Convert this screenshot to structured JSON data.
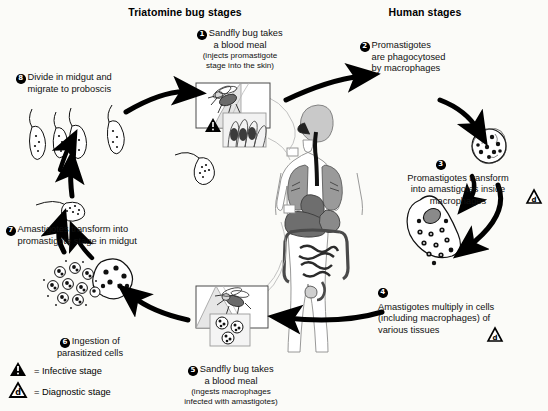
{
  "diagram": {
    "headers": {
      "left": "Triatomine bug stages",
      "right": "Human stages"
    },
    "steps": [
      {
        "num": "1",
        "title": "Sandfly bug takes",
        "title2": "a blood meal",
        "sub": "(injects promastigote",
        "sub2": "stage into the skin)",
        "marker": "infective"
      },
      {
        "num": "2",
        "line1": "Promastigotes",
        "line2": "are phagocytosed",
        "line3": "by macrophages",
        "marker": "none"
      },
      {
        "num": "3",
        "line1": "Promastigotes transform",
        "line2": "into amastigotes inside",
        "line3": "macrophages",
        "marker": "diagnostic"
      },
      {
        "num": "4",
        "line1": "Amastigotes multiply in cells",
        "line2": "(including macrophages) of",
        "line3": "various tissues",
        "marker": "diagnostic"
      },
      {
        "num": "5",
        "title": "Sandfly bug takes",
        "title2": "a blood meal",
        "sub": "(ingests macrophages",
        "sub2": "infected with amastigotes)",
        "marker": "none"
      },
      {
        "num": "6",
        "line1": "Ingestion of",
        "line2": "parasitized cells",
        "marker": "none"
      },
      {
        "num": "7",
        "line1": "Amastigotes transform into",
        "line2": "promastigote stage in midgut",
        "marker": "none"
      },
      {
        "num": "8",
        "line1": "Divide in midgut and",
        "line2": "migrate to proboscis",
        "marker": "none"
      }
    ],
    "legend": [
      {
        "symbol": "infective-triangle",
        "glyph": "!",
        "text": "= Infective stage"
      },
      {
        "symbol": "diagnostic-triangle",
        "glyph": "d",
        "text": "= Diagnostic stage"
      }
    ],
    "colors": {
      "background": "#fbfbf8",
      "ink": "#000000",
      "organ_gray": "#9a9a9a",
      "organ_dark": "#6e6e6e",
      "organ_light": "#c9c9c9",
      "skin_line": "#8d8d8d"
    }
  }
}
